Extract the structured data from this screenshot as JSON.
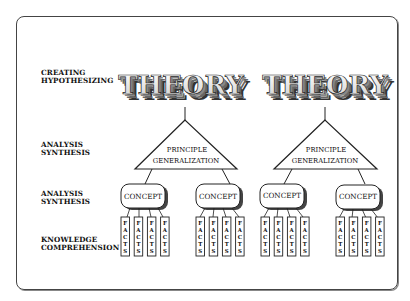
{
  "levels": [
    {
      "lines": [
        "CREATING",
        "HYPOTHESIZING"
      ]
    },
    {
      "lines": [
        "ANALYSIS",
        "SYNTHESIS"
      ]
    },
    {
      "lines": [
        "ANALYSIS",
        "SYNTHESIS"
      ]
    },
    {
      "lines": [
        "KNOWLEDGE",
        "COMPREHENSION"
      ]
    }
  ],
  "trees": [
    {
      "theory": "THEORY",
      "triangle": {
        "line1": "PRINCIPLE",
        "line2": "GENERALIZATION"
      },
      "concepts": [
        {
          "label": "CONCEPT",
          "facts": [
            "FACTS",
            "FACTS",
            "FACTS",
            "FACTS"
          ]
        },
        {
          "label": "CONCEPT",
          "facts": [
            "FACTS",
            "FACTS",
            "FACTS",
            "FACTS"
          ]
        }
      ]
    },
    {
      "theory": "THEORY",
      "triangle": {
        "line1": "PRINCIPLE",
        "line2": "GENERALIZATION"
      },
      "concepts": [
        {
          "label": "CONCEPT",
          "facts": [
            "FACTS",
            "FACTS",
            "FACTS",
            "FACTS"
          ]
        },
        {
          "label": "CONCEPT",
          "facts": [
            "FACTS",
            "FACTS",
            "FACTS",
            "FACTS"
          ]
        }
      ]
    }
  ],
  "colors": {
    "line": "#222222",
    "shadow": "#555555",
    "concept_fill": "#ffffff"
  }
}
